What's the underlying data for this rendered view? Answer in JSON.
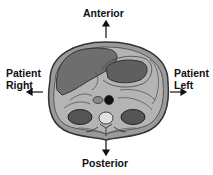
{
  "diagram": {
    "type": "axial cross-section orientation diagram",
    "labels": {
      "anterior": "Anterior",
      "posterior": "Posterior",
      "patient_right_line1": "Patient",
      "patient_right_line2": "Right",
      "patient_left_line1": "Patient",
      "patient_left_line2": "Left"
    },
    "colors": {
      "body_fill": "#9a9a9a",
      "inner_fill": "#b4b4b4",
      "organ_dark": "#5a5a5a",
      "outline": "#333333",
      "text": "#111111"
    }
  }
}
